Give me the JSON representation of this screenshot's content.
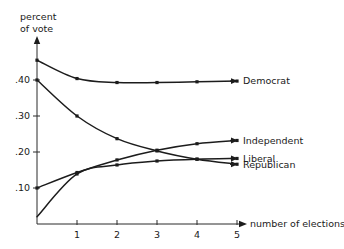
{
  "chart_data": {
    "type": "line",
    "title": "",
    "xlabel": "number of elections",
    "ylabel": "percent of vote",
    "ylabel_line1": "percent",
    "ylabel_line2": "of vote",
    "x": [
      0,
      1,
      2,
      3,
      4,
      5
    ],
    "xlim": [
      0,
      5.35
    ],
    "ylim": [
      0,
      0.48
    ],
    "xticks": [
      1,
      2,
      3,
      4,
      5
    ],
    "xtick_labels": [
      "1",
      "2",
      "3",
      "4",
      "5"
    ],
    "yticks": [
      0.1,
      0.2,
      0.3,
      0.4
    ],
    "ytick_labels": [
      ".10",
      ".20",
      ".30",
      ".40"
    ],
    "grid": false,
    "legend_position": "right-inline-labels",
    "series": [
      {
        "name": "Democrat",
        "label": "Democrat",
        "values": [
          0.455,
          0.404,
          0.393,
          0.393,
          0.395,
          0.397
        ],
        "label_x": 5.3,
        "label_y": 0.397,
        "color": "#1c1c1c"
      },
      {
        "name": "Independent",
        "label": "Independent",
        "values": [
          0.1,
          0.143,
          0.178,
          0.205,
          0.223,
          0.232
        ],
        "label_x": 5.3,
        "label_y": 0.232,
        "color": "#1c1c1c"
      },
      {
        "name": "Liberal",
        "label": "Liberal",
        "values": [
          0.02,
          0.139,
          0.164,
          0.175,
          0.18,
          0.182
        ],
        "label_x": 5.3,
        "label_y": 0.182,
        "color": "#1c1c1c"
      },
      {
        "name": "Republican",
        "label": "Republican",
        "values": [
          0.4,
          0.3,
          0.237,
          0.203,
          0.18,
          0.166
        ],
        "label_x": 5.3,
        "label_y": 0.166,
        "color": "#1c1c1c"
      }
    ],
    "axis_color": "#2b2b2b",
    "background": "#ffffff"
  },
  "geometry": {
    "origin_x": 37,
    "origin_y": 224,
    "x_unit_px": 40,
    "y_unit_px": 360,
    "y_axis_top": 38,
    "x_axis_right": 240
  }
}
